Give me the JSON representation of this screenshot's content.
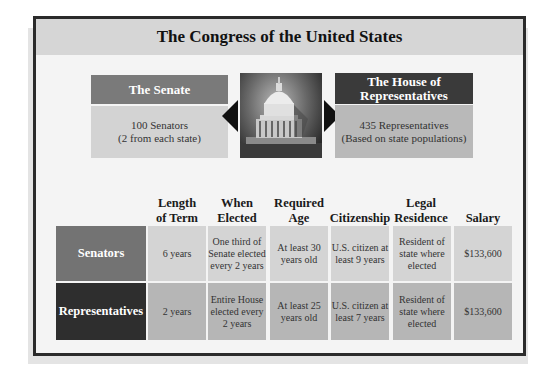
{
  "title": "The Congress of the United States",
  "senate": {
    "heading": "The Senate",
    "line1": "100 Senators",
    "line2": "(2 from each state)"
  },
  "house": {
    "heading_line1": "The House of",
    "heading_line2": "Representatives",
    "line1": "435 Representatives",
    "line2": "(Based on state populations)"
  },
  "image": {
    "icon": "capitol-dome-icon",
    "description": "U.S. Capitol dome"
  },
  "table": {
    "columns": [
      {
        "line1": "Length",
        "line2": "of Term"
      },
      {
        "line1": "When",
        "line2": "Elected"
      },
      {
        "line1": "Required",
        "line2": "Age"
      },
      {
        "line1": "",
        "line2": "Citizenship"
      },
      {
        "line1": "Legal",
        "line2": "Residence"
      },
      {
        "line1": "",
        "line2": "Salary"
      }
    ],
    "rows": [
      {
        "label": "Senators",
        "cells": [
          "6 years",
          "One third of Senate elected every 2 years",
          "At least 30 years old",
          "U.S. citizen at least 9 years",
          "Resident of state where elected",
          "$133,600"
        ]
      },
      {
        "label": "Representatives",
        "cells": [
          "2 years",
          "Entire House elected every 2 years",
          "At least 25 years old",
          "U.S. citizen at least 7 years",
          "Resident of state where elected",
          "$133,600"
        ]
      }
    ]
  },
  "colors": {
    "frame_border": "#2b2b2b",
    "title_band": "#d6d6d6",
    "senate_header": "#7a7a7a",
    "house_header": "#3a3a3a",
    "senators_row_label": "#737373",
    "representatives_row_label": "#2e2e2e",
    "senators_row_cell": "#d4d4d4",
    "representatives_row_cell": "#b6b6b6"
  }
}
